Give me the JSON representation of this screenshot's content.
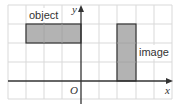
{
  "diagram": {
    "type": "coordinate-grid-transformation",
    "grid": {
      "columns": 9,
      "rows": 5,
      "origin_col": 4,
      "origin_row_from_top": 4,
      "line_color": "#d9d9d9"
    },
    "axes": {
      "x_label": "x",
      "y_label": "y",
      "origin_label": "O",
      "color": "#333333"
    },
    "shapes": [
      {
        "name": "object",
        "label": "object",
        "x_range": [
          -3,
          0
        ],
        "y_range": [
          2,
          3
        ],
        "fill": "#b3b3b3",
        "stroke": "#333333"
      },
      {
        "name": "image",
        "label": "image",
        "x_range": [
          2,
          3
        ],
        "y_range": [
          0,
          3
        ],
        "fill": "#b3b3b3",
        "stroke": "#333333"
      }
    ]
  }
}
